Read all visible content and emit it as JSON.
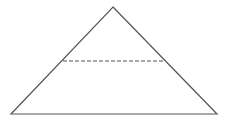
{
  "diagram": {
    "type": "geometry",
    "stroke_color": "#555555",
    "background": "#ffffff",
    "triangle": {
      "apex": [
        113,
        7
      ],
      "base_left": [
        11,
        114
      ],
      "base_right": [
        217,
        114
      ]
    },
    "dashed_segment": {
      "start": [
        63,
        61
      ],
      "end": [
        165,
        61
      ],
      "dash": "4,2"
    }
  }
}
